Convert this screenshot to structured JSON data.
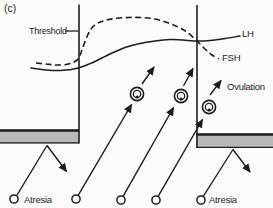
{
  "labels": {
    "panel": "(c)",
    "threshold": "Threshold",
    "lh": "LH",
    "fsh": "FSH",
    "ovulation": "Ovulation",
    "atresia_left": "Atresia",
    "atresia_right": "Atresia"
  },
  "colors": {
    "ink": "#1c1c1c",
    "bar_fill": "#b9b9b9",
    "background": "#fcfcfb"
  },
  "figure": {
    "width": 273,
    "height": 208,
    "vertical_lines": [
      {
        "name": "cycle-boundary-left",
        "x": 79,
        "y1": 4.5,
        "y2": 143.5
      },
      {
        "name": "cycle-boundary-right",
        "x": 197,
        "y1": 5,
        "y2": 148
      }
    ],
    "bars": [
      {
        "name": "atresia-barrier-left",
        "x": 0,
        "y": 129.5,
        "w": 79,
        "h": 14
      },
      {
        "name": "atresia-barrier-right",
        "x": 196.3,
        "y": 133.5,
        "w": 76.7,
        "h": 14.5
      }
    ],
    "curves": {
      "lh": {
        "style": "solid",
        "points": [
          [
            31,
            68
          ],
          [
            42,
            69.5
          ],
          [
            54,
            70.5
          ],
          [
            66,
            70
          ],
          [
            74,
            69
          ],
          [
            80,
            67.5
          ],
          [
            88,
            64.5
          ],
          [
            95,
            61.5
          ],
          [
            110,
            54
          ],
          [
            125,
            47.5
          ],
          [
            140,
            43.5
          ],
          [
            155,
            41
          ],
          [
            170,
            39.5
          ],
          [
            183,
            40
          ],
          [
            197,
            41
          ],
          [
            210,
            40.5
          ],
          [
            225,
            38.5
          ],
          [
            240,
            36
          ]
        ]
      },
      "fsh": {
        "style": "dashed",
        "points": [
          [
            36,
            63
          ],
          [
            46,
            64
          ],
          [
            56,
            65
          ],
          [
            66,
            64.5
          ],
          [
            73,
            62.5
          ],
          [
            78,
            59
          ],
          [
            82,
            50
          ],
          [
            86,
            39
          ],
          [
            91,
            29
          ],
          [
            97,
            23.5
          ],
          [
            105,
            20.5
          ],
          [
            115,
            18.5
          ],
          [
            128,
            17.5
          ],
          [
            142,
            17.5
          ],
          [
            155,
            19
          ],
          [
            167,
            22.5
          ],
          [
            178,
            27
          ],
          [
            187,
            32
          ],
          [
            197,
            41
          ],
          [
            205,
            49
          ],
          [
            212,
            55
          ],
          [
            219,
            59
          ]
        ]
      }
    },
    "pointer_lines": [
      {
        "name": "threshold-pointer",
        "x1": 65,
        "y1": 31,
        "x2": 78.5,
        "y2": 31
      },
      {
        "name": "atresia-path-left",
        "x1": 17,
        "y1": 195.2,
        "x2": 47,
        "y2": 145.5
      },
      {
        "name": "atresia-path-right",
        "x1": 203.4,
        "y1": 196.2,
        "x2": 233,
        "y2": 149.5
      }
    ],
    "arrows": [
      {
        "name": "growth-arrow-1",
        "x1": 78.3,
        "y1": 195.1,
        "x2": 131.5,
        "y2": 104.5
      },
      {
        "name": "growth-arrow-2",
        "x1": 123.2,
        "y1": 196.1,
        "x2": 173.5,
        "y2": 107.5
      },
      {
        "name": "growth-arrow-3",
        "x1": 158.3,
        "y1": 196.1,
        "x2": 202.5,
        "y2": 119.5
      },
      {
        "name": "atresia-deflect-arrow-left",
        "x1": 47,
        "y1": 145.5,
        "x2": 66.5,
        "y2": 171.5
      },
      {
        "name": "atresia-deflect-arrow-right",
        "x1": 233,
        "y1": 149.5,
        "x2": 250,
        "y2": 172
      },
      {
        "name": "continue-growth-arrow-1",
        "x1": 142,
        "y1": 84,
        "x2": 154,
        "y2": 67
      },
      {
        "name": "continue-growth-arrow-2",
        "x1": 183.5,
        "y1": 86,
        "x2": 193,
        "y2": 68.5
      },
      {
        "name": "ovulation-arrow",
        "x1": 210,
        "y1": 95,
        "x2": 221,
        "y2": 80.5
      }
    ],
    "follicles": [
      {
        "cx": 137,
        "cy": 94
      },
      {
        "cx": 181,
        "cy": 96
      },
      {
        "cx": 209,
        "cy": 107
      }
    ],
    "primordial_follicles": [
      {
        "cx": 14,
        "cy": 199
      },
      {
        "cx": 76,
        "cy": 199
      },
      {
        "cx": 121,
        "cy": 200
      },
      {
        "cx": 156,
        "cy": 200
      },
      {
        "cx": 201,
        "cy": 200
      }
    ]
  }
}
